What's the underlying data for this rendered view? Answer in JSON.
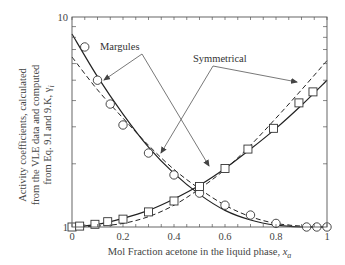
{
  "chart_data": {
    "type": "line",
    "title": "",
    "xlabel": "Mol Fraction acetone in the liquid phase, x_a",
    "xlabel_main": "Mol Fraction acetone in the liquid phase, ",
    "xlabel_var": "x",
    "xlabel_sub": "a",
    "ylabel_lines": [
      "Activity coefficients, calculated",
      "from the VLE data and computed",
      "from Eq. 9.I and 9.K, γ"
    ],
    "ylabel_sub": "i",
    "yscale": "log",
    "xlim": [
      0,
      1
    ],
    "ylim": [
      1,
      10
    ],
    "x_ticks": [
      0,
      0.2,
      0.4,
      0.6,
      0.8,
      1
    ],
    "x_tick_labels": [
      "0",
      "0.2",
      "0.4",
      "0.6",
      "0.8",
      "1"
    ],
    "y_tick_labels": [
      "1",
      "10"
    ],
    "grid": false,
    "legend": "none",
    "annotations": [
      {
        "text": "Margules",
        "points_to": [
          "solid acetone curve near x=0.1",
          "solid water curve near x=0.53"
        ]
      },
      {
        "text": "Symmetrical",
        "points_to": [
          "dashed water curve near x=0.88",
          "dashed acetone curve near x=0.35"
        ]
      }
    ],
    "series": [
      {
        "name": "Acetone activity coefficient (VLE data)",
        "marker": "circle",
        "x": [
          0.05,
          0.1,
          0.15,
          0.2,
          0.3,
          0.4,
          0.5,
          0.6,
          0.7,
          0.8,
          0.92,
          0.96,
          1.0
        ],
        "y": [
          7.2,
          5.0,
          3.85,
          3.06,
          2.25,
          1.77,
          1.45,
          1.27,
          1.14,
          1.04,
          1.0,
          1.0,
          1.0
        ]
      },
      {
        "name": "Water activity coefficient (VLE data)",
        "marker": "square",
        "x": [
          0.0,
          0.03,
          0.09,
          0.14,
          0.2,
          0.3,
          0.4,
          0.5,
          0.6,
          0.69,
          0.79,
          0.89,
          0.945
        ],
        "y": [
          1.0,
          1.01,
          1.03,
          1.06,
          1.09,
          1.18,
          1.33,
          1.56,
          1.9,
          2.35,
          2.95,
          3.9,
          4.4
        ]
      },
      {
        "name": "Margules – acetone",
        "style": "solid",
        "x": [
          0,
          0.1,
          0.2,
          0.3,
          0.4,
          0.5,
          0.6,
          0.7,
          0.8,
          0.9,
          1.0
        ],
        "y": [
          8.3,
          5.2,
          3.45,
          2.4,
          1.8,
          1.43,
          1.2,
          1.08,
          1.02,
          1.0,
          1.0
        ]
      },
      {
        "name": "Margules – water",
        "style": "solid",
        "x": [
          0,
          0.1,
          0.2,
          0.3,
          0.4,
          0.5,
          0.6,
          0.7,
          0.8,
          0.9,
          1.0
        ],
        "y": [
          1.0,
          1.03,
          1.1,
          1.2,
          1.36,
          1.58,
          1.9,
          2.35,
          2.95,
          3.8,
          5.0
        ]
      },
      {
        "name": "Symmetrical – acetone",
        "style": "dashed",
        "x": [
          0,
          0.1,
          0.2,
          0.3,
          0.4,
          0.5,
          0.6,
          0.7,
          0.8,
          0.9,
          1.0
        ],
        "y": [
          6.45,
          4.5,
          3.3,
          2.45,
          1.88,
          1.52,
          1.27,
          1.12,
          1.04,
          1.01,
          1.0
        ]
      },
      {
        "name": "Symmetrical – water",
        "style": "dashed",
        "x": [
          0,
          0.1,
          0.2,
          0.3,
          0.4,
          0.5,
          0.6,
          0.7,
          0.8,
          0.9,
          1.0
        ],
        "y": [
          1.0,
          1.01,
          1.04,
          1.12,
          1.27,
          1.52,
          1.88,
          2.45,
          3.3,
          4.5,
          6.2
        ]
      }
    ]
  }
}
